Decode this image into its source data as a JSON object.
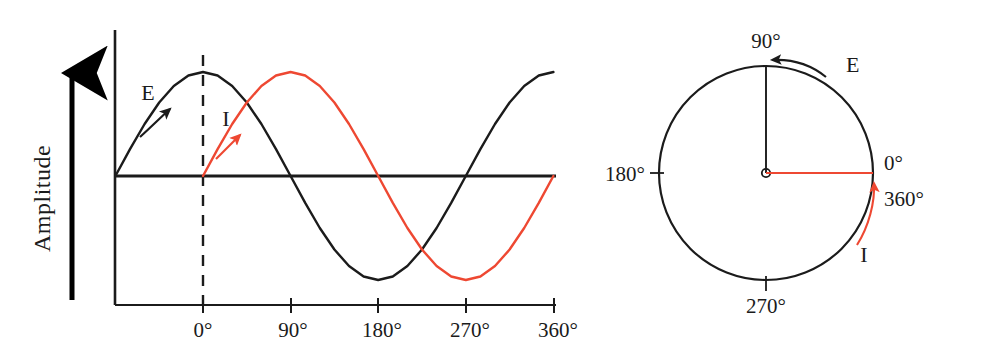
{
  "figure": {
    "colors": {
      "voltage_black": "#1b1b1b",
      "current_red": "#ee4832",
      "background": "#ffffff",
      "axis": "#1b1b1b"
    }
  },
  "wave_panel": {
    "y_axis_title": "Amplitude",
    "x_tick_labels": [
      "0°",
      "90°",
      "180°",
      "270°",
      "360°"
    ],
    "series_labels": {
      "voltage": "E",
      "current": "I"
    }
  },
  "phasor_panel": {
    "angle_labels": {
      "top": "90°",
      "left": "180°",
      "bottom": "270°",
      "right_zero": "0°",
      "right_full": "360°"
    },
    "phasor_labels": {
      "voltage": "E",
      "current": "I"
    }
  },
  "chart_data": {
    "type": "line",
    "xlabel": "",
    "ylabel": "Amplitude",
    "xlim": [
      -90,
      360
    ],
    "ylim": [
      -1,
      1
    ],
    "x_ticks": [
      0,
      90,
      180,
      270,
      360
    ],
    "x_tick_labels": [
      "0°",
      "90°",
      "180°",
      "270°",
      "360°"
    ],
    "grid": false,
    "legend": "inline-annotations",
    "annotations": [
      {
        "text": "E",
        "series": "E",
        "x": -55,
        "y": 0.86,
        "note": "label on rising black curve with arrow along curve"
      },
      {
        "text": "I",
        "series": "I",
        "x": 22,
        "y": 0.62,
        "note": "label on rising red curve with arrow along curve"
      }
    ],
    "series": [
      {
        "name": "E",
        "color": "#1b1b1b",
        "phase_deg": 90,
        "formula": "sin(x + 90°)",
        "x": [
          -90,
          -75,
          -60,
          -45,
          -30,
          -15,
          0,
          15,
          30,
          45,
          60,
          75,
          90,
          105,
          120,
          135,
          150,
          165,
          180,
          195,
          210,
          225,
          240,
          255,
          270,
          285,
          300,
          315,
          330,
          345,
          360
        ],
        "values": [
          0,
          0.259,
          0.5,
          0.707,
          0.866,
          0.966,
          1,
          0.966,
          0.866,
          0.707,
          0.5,
          0.259,
          0,
          -0.259,
          -0.5,
          -0.707,
          -0.866,
          -0.966,
          -1,
          -0.966,
          -0.866,
          -0.707,
          -0.5,
          -0.259,
          0,
          0.259,
          0.5,
          0.707,
          0.866,
          0.966,
          1
        ]
      },
      {
        "name": "I",
        "color": "#ee4832",
        "phase_deg": 0,
        "formula": "sin(x)",
        "x": [
          0,
          15,
          30,
          45,
          60,
          75,
          90,
          105,
          120,
          135,
          150,
          165,
          180,
          195,
          210,
          225,
          240,
          255,
          270,
          285,
          300,
          315,
          330,
          345,
          360
        ],
        "values": [
          0,
          0.259,
          0.5,
          0.707,
          0.866,
          0.966,
          1,
          0.966,
          0.866,
          0.707,
          0.5,
          0.259,
          0,
          -0.259,
          -0.5,
          -0.707,
          -0.866,
          -0.966,
          -1,
          -0.966,
          -0.866,
          -0.707,
          -0.5,
          -0.259,
          0
        ]
      }
    ],
    "phase_relationship": "I lags E by 90°"
  }
}
